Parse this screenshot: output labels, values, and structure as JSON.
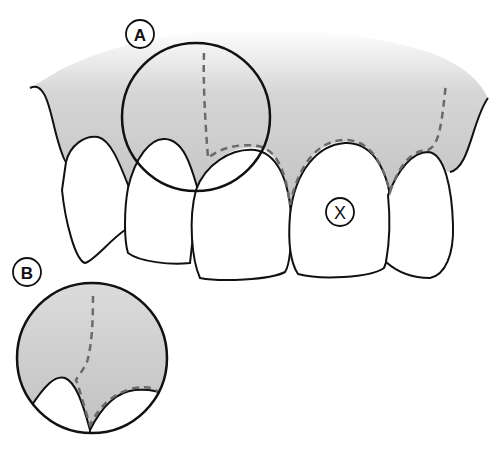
{
  "diagram": {
    "labels": {
      "a": "A",
      "b": "B",
      "x": "X"
    },
    "callouts": [
      {
        "id": "A",
        "description": "Magnifying circle over interdental papilla between central and lateral incisor"
      },
      {
        "id": "B",
        "description": "Enlarged detail view of the region circled in A"
      },
      {
        "id": "X",
        "description": "Marked tooth (central incisor)"
      }
    ],
    "colors": {
      "gingiva": "#c4c4c4",
      "outline": "#111111",
      "dashed_line": "#6a6a6a",
      "tooth": "#ffffff"
    }
  }
}
